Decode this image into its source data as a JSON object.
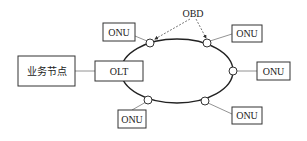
{
  "diagram": {
    "type": "pon-ring-topology",
    "service_node": {
      "label": "业务节点"
    },
    "olt": {
      "label": "OLT"
    },
    "obd_label": "OBD",
    "onus": [
      {
        "id": "onu-top-left",
        "label": "ONU"
      },
      {
        "id": "onu-top-right",
        "label": "ONU"
      },
      {
        "id": "onu-right",
        "label": "ONU"
      },
      {
        "id": "onu-bottom-left",
        "label": "ONU"
      },
      {
        "id": "onu-bottom-right",
        "label": "ONU"
      }
    ],
    "colors": {
      "line": "#222222",
      "box_border": "#333333",
      "background": "#ffffff"
    }
  }
}
